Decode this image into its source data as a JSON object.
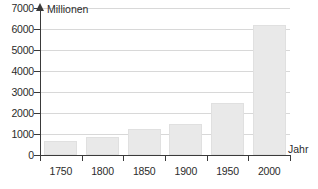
{
  "chart_data": {
    "type": "bar",
    "title": "",
    "xlabel": "Jahr",
    "ylabel": "Millionen",
    "categories": [
      "1750",
      "1800",
      "1850",
      "1900",
      "1950",
      "2000"
    ],
    "values": [
      660,
      850,
      1250,
      1500,
      2500,
      6200
    ],
    "ylim": [
      0,
      7000
    ],
    "y_ticks": [
      "0",
      "1000",
      "2000",
      "3000",
      "4000",
      "5000",
      "6000",
      "7000"
    ],
    "y_tick_values": [
      0,
      1000,
      2000,
      3000,
      4000,
      5000,
      6000,
      7000
    ],
    "grid": true,
    "legend": "none",
    "bar_color": "#e9e9e9",
    "axis_color": "#3a3a3a",
    "grid_color": "#d8d8d8"
  }
}
